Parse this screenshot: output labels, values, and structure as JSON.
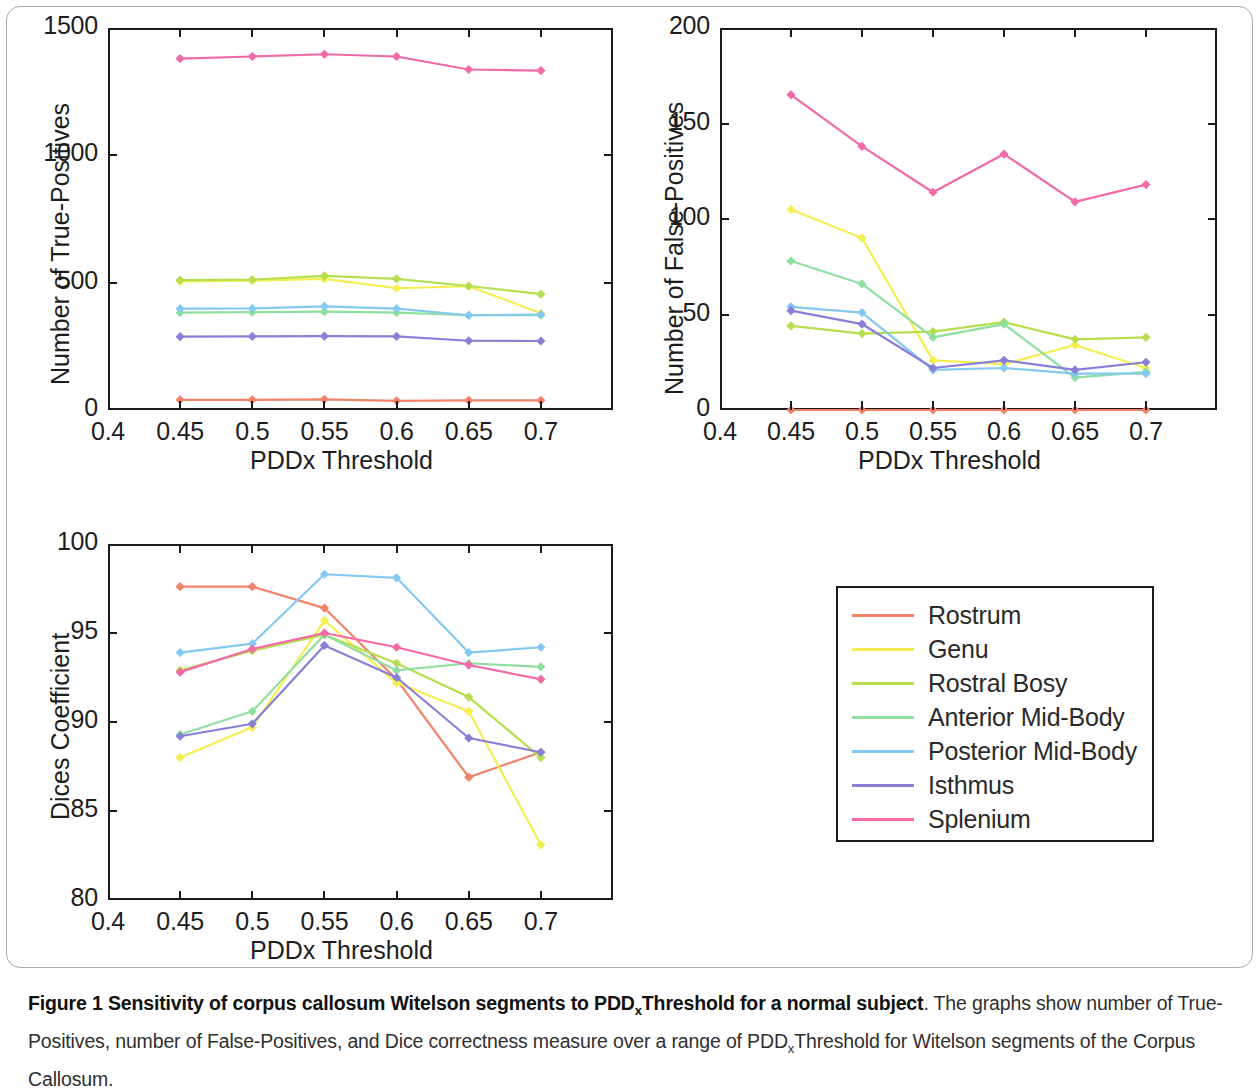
{
  "figure": {
    "caption_bold": "Figure 1 Sensitivity of corpus callosum Witelson segments to PDD",
    "caption_bold_sub": "x",
    "caption_bold_tail": "Threshold for a normal subject",
    "caption_rest_1": ". The graphs show number of True-Positives, number of False-Positives, and Dice correctness measure over a range of PDD",
    "caption_sub_2": "x",
    "caption_rest_2": "Threshold for Witelson segments of the Corpus Callosum."
  },
  "legend": {
    "position": "right-middle",
    "items": [
      {
        "label": "Rostrum",
        "color": "#f4826a"
      },
      {
        "label": "Genu",
        "color": "#f4ee52"
      },
      {
        "label": "Rostral Bosy",
        "color": "#b5df4e"
      },
      {
        "label": "Anterior Mid-Body",
        "color": "#8fe0a0"
      },
      {
        "label": "Posterior Mid-Body",
        "color": "#85c9f0"
      },
      {
        "label": "Isthmus",
        "color": "#8a7fd6"
      },
      {
        "label": "Splenium",
        "color": "#f269a8"
      }
    ]
  },
  "chart_data": [
    {
      "id": "true-positives",
      "type": "line",
      "title": "",
      "xlabel": "PDDx Threshold",
      "ylabel": "Number of True-Positives",
      "x": [
        0.45,
        0.5,
        0.55,
        0.6,
        0.65,
        0.7
      ],
      "xticks": [
        "0.4",
        "0.45",
        "0.5",
        "0.55",
        "0.6",
        "0.65",
        "0.7"
      ],
      "xtickvals": [
        0.4,
        0.45,
        0.5,
        0.55,
        0.6,
        0.65,
        0.7
      ],
      "yticks": [
        "0",
        "500",
        "1000",
        "1500"
      ],
      "ytickvals": [
        0,
        500,
        1000,
        1500
      ],
      "xlim": [
        0.4,
        0.75
      ],
      "ylim": [
        0,
        1500
      ],
      "grid": false,
      "series": [
        {
          "name": "Rostrum",
          "color": "#f4826a",
          "values": [
            40,
            40,
            42,
            36,
            38,
            38
          ]
        },
        {
          "name": "Genu",
          "color": "#f4ee52",
          "values": [
            505,
            508,
            515,
            478,
            486,
            380
          ]
        },
        {
          "name": "Rostral Bosy",
          "color": "#b5df4e",
          "values": [
            510,
            512,
            527,
            515,
            487,
            455
          ]
        },
        {
          "name": "Anterior Mid-Body",
          "color": "#8fe0a0",
          "values": [
            382,
            384,
            386,
            382,
            372,
            372
          ]
        },
        {
          "name": "Posterior Mid-Body",
          "color": "#85c9f0",
          "values": [
            398,
            399,
            407,
            398,
            372,
            375
          ]
        },
        {
          "name": "Isthmus",
          "color": "#8a7fd6",
          "values": [
            288,
            289,
            290,
            289,
            272,
            271
          ]
        },
        {
          "name": "Splenium",
          "color": "#f269a8",
          "values": [
            1380,
            1388,
            1397,
            1388,
            1337,
            1333
          ]
        }
      ]
    },
    {
      "id": "false-positives",
      "type": "line",
      "title": "",
      "xlabel": "PDDx Threshold",
      "ylabel": "Number of False-Positives",
      "x": [
        0.45,
        0.5,
        0.55,
        0.6,
        0.65,
        0.7
      ],
      "xticks": [
        "0.4",
        "0.45",
        "0.5",
        "0.55",
        "0.6",
        "0.65",
        "0.7"
      ],
      "xtickvals": [
        0.4,
        0.45,
        0.5,
        0.55,
        0.6,
        0.65,
        0.7
      ],
      "yticks": [
        "0",
        "50",
        "100",
        "150",
        "200"
      ],
      "ytickvals": [
        0,
        50,
        100,
        150,
        200
      ],
      "xlim": [
        0.4,
        0.75
      ],
      "ylim": [
        0,
        200
      ],
      "grid": false,
      "series": [
        {
          "name": "Rostrum",
          "color": "#f4826a",
          "values": [
            0,
            0,
            0,
            0,
            0,
            0
          ]
        },
        {
          "name": "Genu",
          "color": "#f4ee52",
          "values": [
            105,
            90,
            26,
            24,
            34,
            22
          ]
        },
        {
          "name": "Rostral Bosy",
          "color": "#b5df4e",
          "values": [
            44,
            40,
            41,
            46,
            37,
            38
          ]
        },
        {
          "name": "Anterior Mid-Body",
          "color": "#8fe0a0",
          "values": [
            78,
            66,
            38,
            45,
            17,
            20
          ]
        },
        {
          "name": "Posterior Mid-Body",
          "color": "#85c9f0",
          "values": [
            54,
            51,
            21,
            22,
            19,
            19
          ]
        },
        {
          "name": "Isthmus",
          "color": "#8a7fd6",
          "values": [
            52,
            45,
            22,
            26,
            21,
            25
          ]
        },
        {
          "name": "Splenium",
          "color": "#f269a8",
          "values": [
            165,
            138,
            114,
            134,
            109,
            118
          ]
        }
      ]
    },
    {
      "id": "dices-coefficient",
      "type": "line",
      "title": "",
      "xlabel": "PDDx Threshold",
      "ylabel": "Dices Coefficient",
      "x": [
        0.45,
        0.5,
        0.55,
        0.6,
        0.65,
        0.7
      ],
      "xticks": [
        "0.4",
        "0.45",
        "0.5",
        "0.55",
        "0.6",
        "0.65",
        "0.7"
      ],
      "xtickvals": [
        0.4,
        0.45,
        0.5,
        0.55,
        0.6,
        0.65,
        0.7
      ],
      "yticks": [
        "80",
        "85",
        "90",
        "95",
        "100"
      ],
      "ytickvals": [
        80,
        85,
        90,
        95,
        100
      ],
      "xlim": [
        0.4,
        0.75
      ],
      "ylim": [
        80,
        100
      ],
      "grid": false,
      "series": [
        {
          "name": "Rostrum",
          "color": "#f4826a",
          "values": [
            97.6,
            97.6,
            96.4,
            92.4,
            86.9,
            88.3
          ]
        },
        {
          "name": "Genu",
          "color": "#f4ee52",
          "values": [
            88.0,
            89.7,
            95.7,
            92.2,
            90.6,
            83.1
          ]
        },
        {
          "name": "Rostral Bosy",
          "color": "#b5df4e",
          "values": [
            92.9,
            94.0,
            94.9,
            93.3,
            91.4,
            88.0
          ]
        },
        {
          "name": "Anterior Mid-Body",
          "color": "#8fe0a0",
          "values": [
            89.3,
            90.6,
            94.9,
            92.9,
            93.3,
            93.1
          ]
        },
        {
          "name": "Posterior Mid-Body",
          "color": "#85c9f0",
          "values": [
            93.9,
            94.4,
            98.3,
            98.1,
            93.9,
            94.2
          ]
        },
        {
          "name": "Isthmus",
          "color": "#8a7fd6",
          "values": [
            89.2,
            89.9,
            94.3,
            92.5,
            89.1,
            88.3
          ]
        },
        {
          "name": "Splenium",
          "color": "#f269a8",
          "values": [
            92.8,
            94.1,
            95.0,
            94.2,
            93.2,
            92.4
          ]
        }
      ]
    }
  ]
}
